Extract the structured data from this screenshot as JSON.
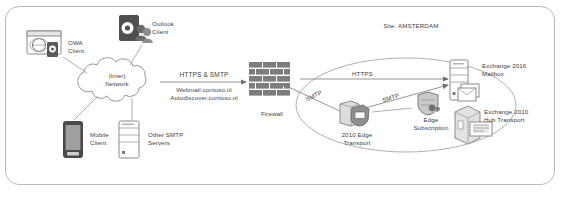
{
  "diagram": {
    "border_color": "#b9b9b9",
    "line_color": "#8a8a8a",
    "text_color": "#3f3f3f",
    "accent_dark": "#4a4a4a"
  },
  "clients": {
    "owa": {
      "label": "OWA\nClient",
      "icon": "browser-globe-icon"
    },
    "outlook": {
      "label": "Outlook\nClient",
      "icon": "outlook-users-icon"
    },
    "mobile": {
      "label": "Mobile\nClient",
      "icon": "mobile-phone-icon"
    },
    "other_smtp": {
      "label": "Other SMTP\nServers",
      "icon": "server-tower-icon"
    }
  },
  "network": {
    "cloud_label": "(Inter)\nNetwork",
    "icon": "cloud-icon"
  },
  "firewall": {
    "label": "Firewall",
    "icon": "brick-wall-icon"
  },
  "connections": {
    "client_to_firewall": {
      "protocol": "HTTPS & SMTP",
      "hosts": "Webmail.contoso.nl\nAutodiscover.contoso.nl"
    },
    "firewall_to_mailbox": {
      "protocol": "HTTPS"
    },
    "firewall_to_edge": {
      "protocol": "SMTP"
    },
    "edge_to_mailbox": {
      "protocol": "SMTP"
    }
  },
  "site": {
    "label": "Site: AMSTERDAM",
    "nodes": {
      "mailbox": {
        "label": "Exchange 2016\nMailbox",
        "icon": "server-mailbox-icon"
      },
      "edge_transport": {
        "label": "2010 Edge\nTransport",
        "icon": "server-shield-icon"
      },
      "edge_subscription": {
        "label": "Edge\nSubscription",
        "icon": "shield-key-icon"
      },
      "hub_transport": {
        "label": "Exchange 2010\nHub Transport",
        "icon": "server-box-icon"
      }
    }
  }
}
